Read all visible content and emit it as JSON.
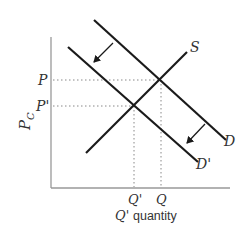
{
  "diagram": {
    "type": "supply-demand",
    "y_axis_label": "P",
    "y_axis_label_sub": "C",
    "x_axis_label_prefix": "Q'",
    "x_axis_label": "quantity",
    "price_labels": {
      "p": "P",
      "p_prime": "P'"
    },
    "quantity_labels": {
      "q": "Q",
      "q_prime": "Q'"
    },
    "curves": {
      "supply": "S",
      "demand": "D",
      "demand_shifted": "D'"
    },
    "shift_direction": "demand shifts left/down from D to D'",
    "colors": {
      "line": "#1a1a1a",
      "axis": "#999999",
      "guide": "#888888"
    }
  }
}
